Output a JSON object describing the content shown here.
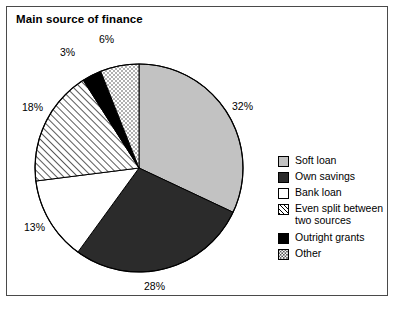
{
  "chart_data": {
    "type": "pie",
    "title": "Main source of finance",
    "xlabel": "",
    "ylabel": "",
    "legend_position": "right",
    "grid": false,
    "start_angle_deg": 0,
    "direction": "clockwise",
    "categories": [
      "Soft loan",
      "Own savings",
      "Bank loan",
      "Even split between two sources",
      "Outright grants",
      "Other"
    ],
    "values": [
      32,
      28,
      13,
      18,
      3,
      6
    ],
    "data_labels": [
      "32%",
      "28%",
      "13%",
      "18%",
      "3%",
      "6%"
    ],
    "slice_styles": [
      "solid-light-gray",
      "solid-dark-gray",
      "solid-white",
      "diagonal-hatch",
      "solid-black",
      "dotted-stipple"
    ],
    "slice_colors": [
      "#c2c2c2",
      "#2b2b2b",
      "#ffffff",
      "#ffffff",
      "#000000",
      "#ffffff"
    ]
  },
  "frame": {
    "border_color": "#4a4a4a",
    "background": "#ffffff"
  },
  "title": {
    "text": "Main source of finance"
  },
  "slices": [
    {
      "label": "Soft loan",
      "value": 32,
      "pct_text": "32%",
      "style": "solid-light-gray",
      "color": "#c2c2c2",
      "label_x": 232,
      "label_y": 101
    },
    {
      "label": "Own savings",
      "value": 28,
      "pct_text": "28%",
      "style": "solid-dark-gray",
      "color": "#2b2b2b",
      "label_x": 144,
      "label_y": 281
    },
    {
      "label": "Bank loan",
      "value": 13,
      "pct_text": "13%",
      "style": "solid-white",
      "color": "#ffffff",
      "label_x": 24,
      "label_y": 222
    },
    {
      "label": "Even split between two sources",
      "value": 18,
      "pct_text": "18%",
      "style": "diagonal-hatch",
      "color": "#ffffff",
      "label_x": 22,
      "label_y": 102
    },
    {
      "label": "Outright grants",
      "value": 3,
      "pct_text": "3%",
      "style": "solid-black",
      "color": "#000000",
      "label_x": 60,
      "label_y": 47
    },
    {
      "label": "Other",
      "value": 6,
      "pct_text": "6%",
      "style": "dotted-stipple",
      "color": "#ffffff",
      "label_x": 99,
      "label_y": 34
    }
  ],
  "legend": {
    "items": [
      {
        "label": "Soft loan",
        "style": "solid-light-gray"
      },
      {
        "label": "Own savings",
        "style": "solid-dark-gray"
      },
      {
        "label": "Bank loan",
        "style": "solid-white"
      },
      {
        "label": "Even split between\ntwo sources",
        "style": "diagonal-hatch"
      },
      {
        "label": "Outright grants",
        "style": "solid-black"
      },
      {
        "label": "Other",
        "style": "dotted-stipple"
      }
    ]
  }
}
